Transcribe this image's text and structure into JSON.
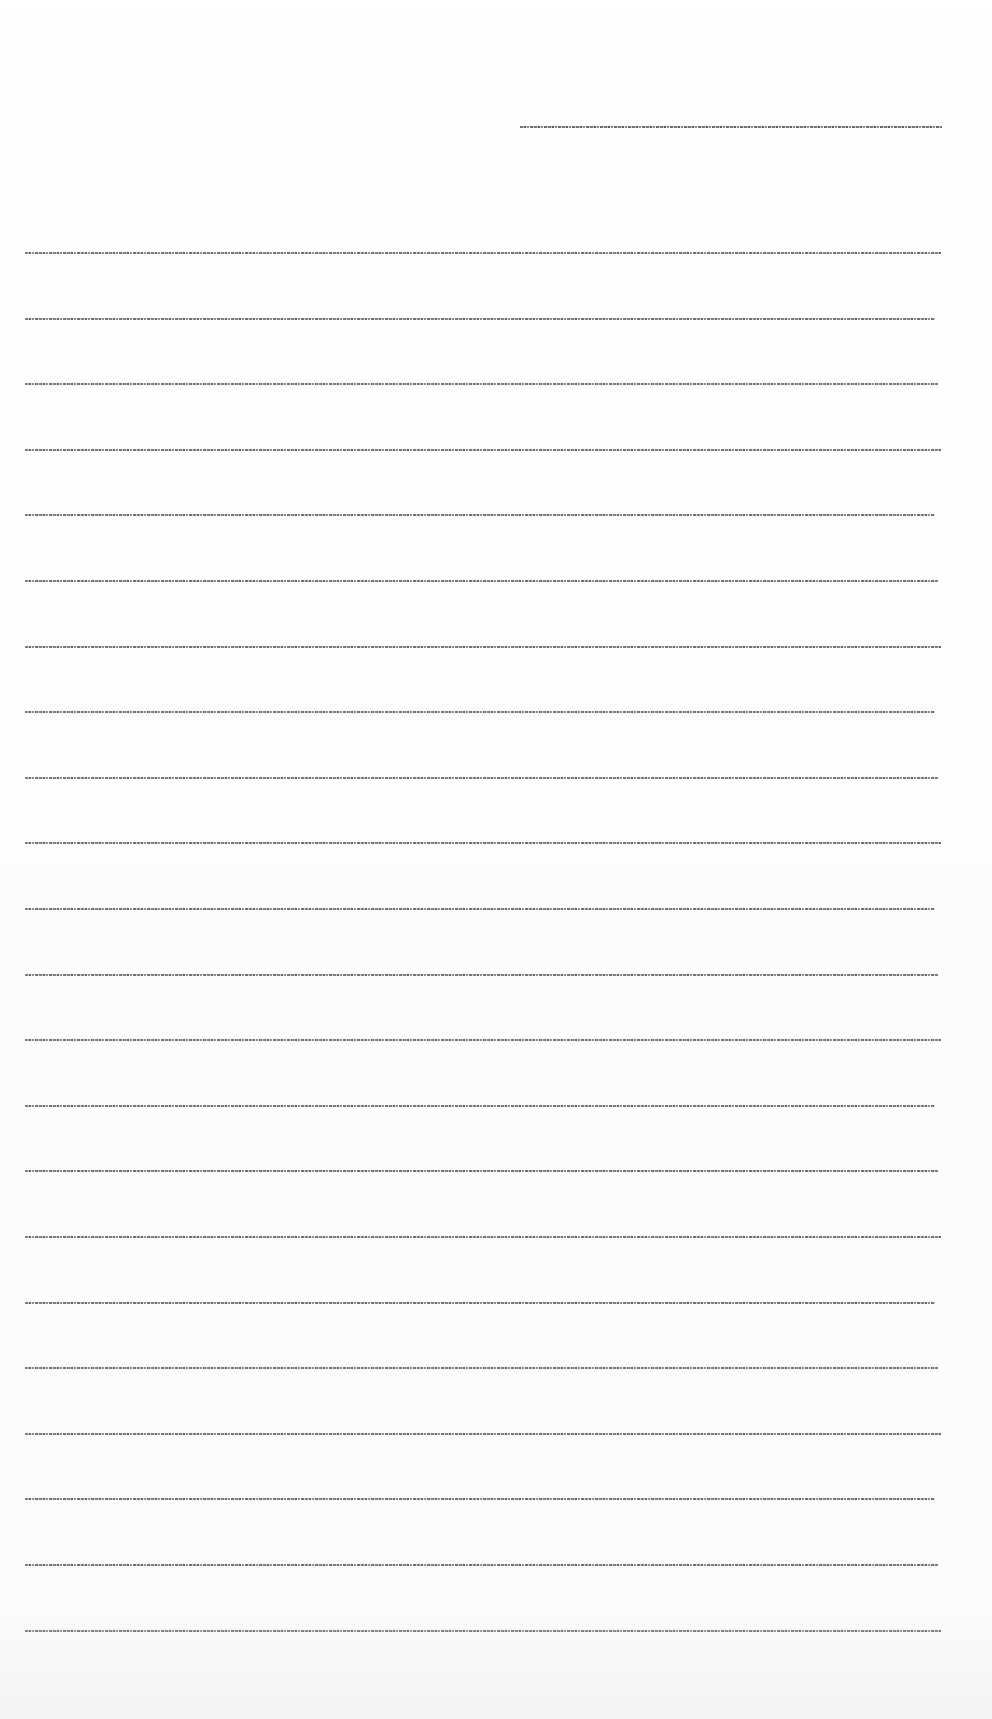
{
  "document": {
    "legibility": "illegible — text rendered at microscopic size",
    "header_line": {
      "x": 520,
      "y": 126,
      "width": 422,
      "text": "[illegible]"
    },
    "body": {
      "x": 25,
      "width": 916,
      "first_y": 252,
      "spacing": 65.6,
      "line_count": 22,
      "lines": [
        {
          "text": "[illegible]"
        },
        {
          "text": "[illegible]"
        },
        {
          "text": "[illegible]"
        },
        {
          "text": "[illegible]"
        },
        {
          "text": "[illegible]"
        },
        {
          "text": "[illegible]"
        },
        {
          "text": "[illegible]"
        },
        {
          "text": "[illegible]"
        },
        {
          "text": "[illegible]"
        },
        {
          "text": "[illegible]"
        },
        {
          "text": "[illegible]"
        },
        {
          "text": "[illegible]"
        },
        {
          "text": "[illegible]"
        },
        {
          "text": "[illegible]"
        },
        {
          "text": "[illegible]"
        },
        {
          "text": "[illegible]"
        },
        {
          "text": "[illegible]"
        },
        {
          "text": "[illegible]"
        },
        {
          "text": "[illegible]"
        },
        {
          "text": "[illegible]"
        },
        {
          "text": "[illegible]"
        },
        {
          "text": "[illegible]"
        }
      ]
    }
  }
}
